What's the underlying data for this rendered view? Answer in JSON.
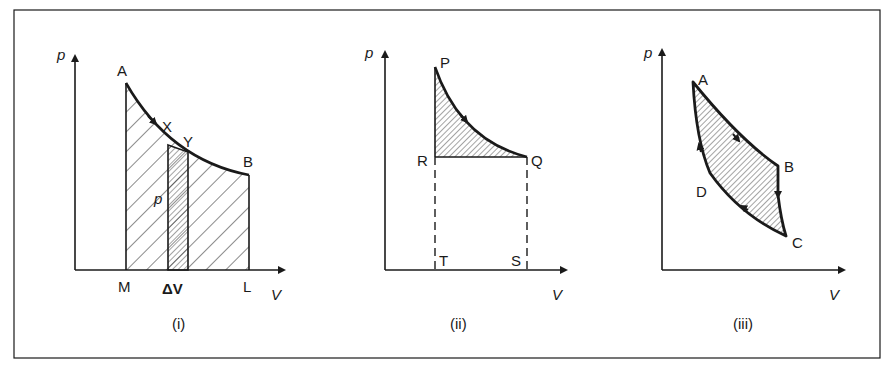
{
  "figure": {
    "panels": [
      {
        "id": "i",
        "caption": "(i)",
        "axis_labels": {
          "y": "p",
          "x": "V"
        },
        "points": {
          "A": "A",
          "B": "B",
          "X": "X",
          "Y": "Y",
          "M": "M",
          "L": "L"
        },
        "strip_height_label": "p",
        "strip_width_label": "ΔV"
      },
      {
        "id": "ii",
        "caption": "(ii)",
        "axis_labels": {
          "y": "p",
          "x": "V"
        },
        "points": {
          "P": "P",
          "Q": "Q",
          "R": "R",
          "S": "S",
          "T": "T"
        }
      },
      {
        "id": "iii",
        "caption": "(iii)",
        "axis_labels": {
          "y": "p",
          "x": "V"
        },
        "points": {
          "A": "A",
          "B": "B",
          "C": "C",
          "D": "D"
        }
      }
    ],
    "colors": {
      "ink": "#1a1a1a",
      "background": "#ffffff"
    }
  }
}
